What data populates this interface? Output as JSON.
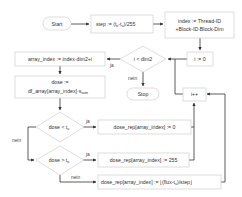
{
  "diagram": {
    "type": "flowchart",
    "nodes": {
      "start": "Start",
      "step": "step := (t",
      "step_sub_o": "o",
      "step_mid": "-t",
      "step_sub_u": "u",
      "step_end": ")/255",
      "index_line1": "index := Thread-ID",
      "index_line2": "+Block-ID·Block-Dim",
      "i_init": "i := 0",
      "cond_i": "i < dim2",
      "array_index": "array_index := index·dim2+i",
      "dose_line1": "dose :=",
      "dose_line2": "df_array[array_index]·s",
      "dose_sub": "sum",
      "stop": "Stop",
      "i_inc": "i++",
      "cond_low": "dose < t",
      "cond_low_sub": "u",
      "cond_high": "dose > t",
      "cond_high_sub": "o",
      "rep_zero": "dose_rep[array_index] := 0",
      "rep_max": "dose_rep[array_index] := 255",
      "rep_scaled": "dose_rep[array_index] := ⌊(flux-t",
      "rep_scaled_sub": "u",
      "rep_scaled_end": ")/step⌋"
    },
    "edge_labels": {
      "yes": "ja",
      "no": "nein"
    },
    "colors": {
      "stroke": "#cfcfcf",
      "arrow": "#333333",
      "text": "#333333",
      "background": "#ffffff"
    }
  }
}
